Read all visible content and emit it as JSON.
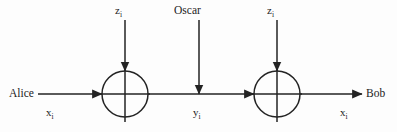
{
  "figure": {
    "background_color": "#fdfdfd",
    "stroke_color": "#232323",
    "text_color": "#232323"
  },
  "labels": {
    "sender": "Alice",
    "receiver": "Bob",
    "eavesdropper": "Oscar",
    "plaintext_in": "x",
    "plaintext_in_sub": "i",
    "plaintext_out": "x",
    "plaintext_out_sub": "i",
    "ciphertext": "y",
    "ciphertext_sub": "i",
    "keystream_left": "z",
    "keystream_left_sub": "i",
    "keystream_right": "z",
    "keystream_right_sub": "i"
  },
  "nodes": [
    {
      "name": "xor-encrypt",
      "symbol": "xor-circle",
      "cx": 125,
      "cy": 94,
      "r": 23
    },
    {
      "name": "xor-decrypt",
      "symbol": "xor-circle",
      "cx": 277,
      "cy": 94,
      "r": 23
    }
  ],
  "edges": [
    {
      "name": "alice-to-encrypt",
      "direction": "right",
      "from": [
        38,
        94
      ],
      "to": [
        102,
        94
      ]
    },
    {
      "name": "encrypt-to-decrypt",
      "direction": "right",
      "from": [
        148,
        94
      ],
      "to": [
        254,
        94
      ]
    },
    {
      "name": "decrypt-to-bob",
      "direction": "right",
      "from": [
        300,
        94
      ],
      "to": [
        362,
        94
      ]
    },
    {
      "name": "keystream-left-in",
      "direction": "down",
      "from": [
        125,
        20
      ],
      "to": [
        125,
        71
      ]
    },
    {
      "name": "oscar-tap",
      "direction": "down",
      "from": [
        199,
        20
      ],
      "to": [
        199,
        94
      ]
    },
    {
      "name": "keystream-right-in",
      "direction": "down",
      "from": [
        277,
        20
      ],
      "to": [
        277,
        71
      ]
    }
  ]
}
